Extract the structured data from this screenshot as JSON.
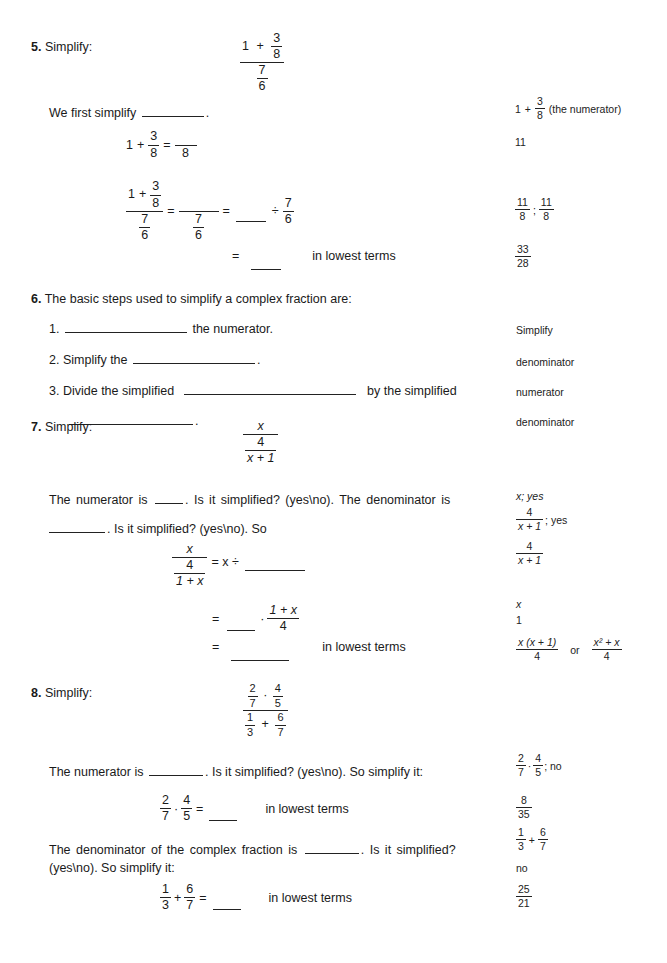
{
  "problems": [
    {
      "number": "5.",
      "prompt": "Simplify:",
      "expression": {
        "num_whole": "1",
        "num_op": "+",
        "num_frac": [
          "3",
          "8"
        ],
        "den_frac": [
          "7",
          "6"
        ]
      },
      "step1": {
        "text_before": "We first simplify",
        "text_after": "."
      },
      "step2": {
        "lhs_whole": "1",
        "op": "+",
        "lhs_frac": [
          "3",
          "8"
        ],
        "eq": "=",
        "rhs_den": "8"
      },
      "step3": {
        "eq": "=",
        "div": "÷",
        "div_frac": [
          "7",
          "6"
        ],
        "den_frac": [
          "7",
          "6"
        ]
      },
      "step4": {
        "eq": "=",
        "suffix": "in lowest terms"
      },
      "answers": {
        "a1_whole": "1",
        "a1_op": "+",
        "a1_frac": [
          "3",
          "8"
        ],
        "a1_note": "(the numerator)",
        "a2": "11",
        "a3_frac1": [
          "11",
          "8"
        ],
        "a3_sep": ";",
        "a3_frac2": [
          "11",
          "8"
        ],
        "a4_frac": [
          "33",
          "28"
        ]
      }
    },
    {
      "number": "6.",
      "prompt": "The basic steps used to simplify a complex fraction are:",
      "steps": [
        {
          "index": "1.",
          "before": "",
          "after": "the numerator."
        },
        {
          "index": "2.",
          "before": "Simplify the",
          "after": "."
        },
        {
          "index": "3.",
          "before": "Divide the simplified",
          "after": "by the simplified"
        },
        {
          "index": "",
          "before": "",
          "after": "."
        }
      ],
      "answers": [
        "Simplify",
        "denominator",
        "numerator",
        "denominator"
      ]
    },
    {
      "number": "7.",
      "prompt": "Simplify:",
      "expression": {
        "num": "x",
        "den_frac": [
          "4",
          "x + 1"
        ]
      },
      "line1": {
        "a": "The numerator is",
        "b": ". Is it simplified? (yes\\no). The denominator is"
      },
      "line2": {
        "b": ". Is it simplified? (yes\\no). So"
      },
      "eq1": {
        "num": "x",
        "den_frac": [
          "4",
          "1 + x"
        ],
        "rhs": "= x ÷"
      },
      "eq2": {
        "eq": "=",
        "dot": "·",
        "frac": [
          "1 + x",
          "4"
        ]
      },
      "eq3": {
        "eq": "=",
        "suffix": "in lowest terms"
      },
      "answers": {
        "a1": "x; yes",
        "a2_frac": [
          "4",
          "x + 1"
        ],
        "a2_suffix": "; yes",
        "a3_frac": [
          "4",
          "x + 1"
        ],
        "a4": "x",
        "a5": "1",
        "a6_frac1": [
          "x (x + 1)",
          "4"
        ],
        "a6_or": "or",
        "a6_frac2": [
          "x² + x",
          "4"
        ]
      }
    },
    {
      "number": "8.",
      "prompt": "Simplify:",
      "expression": {
        "num_frac1": [
          "2",
          "7"
        ],
        "num_dot": "·",
        "num_frac2": [
          "4",
          "5"
        ],
        "den_frac1": [
          "1",
          "3"
        ],
        "den_op": "+",
        "den_frac2": [
          "6",
          "7"
        ]
      },
      "line1": {
        "a": "The numerator is",
        "b": ". Is it simplified? (yes\\no). So simplify it:"
      },
      "eq1": {
        "frac1": [
          "2",
          "7"
        ],
        "dot": "·",
        "frac2": [
          "4",
          "5"
        ],
        "eq": "=",
        "suffix": "in lowest terms"
      },
      "line2": {
        "a": "The denominator of the complex fraction is",
        "b": ". Is it simplified?",
        "c": "(yes\\no). So simplify it:"
      },
      "eq2": {
        "frac1": [
          "1",
          "3"
        ],
        "op": "+",
        "frac2": [
          "6",
          "7"
        ],
        "eq": "=",
        "suffix": "in lowest terms"
      },
      "answers": {
        "a1_frac1": [
          "2",
          "7"
        ],
        "a1_dot": "·",
        "a1_frac2": [
          "4",
          "5"
        ],
        "a1_suffix": "; no",
        "a2_frac": [
          "8",
          "35"
        ],
        "a3_frac1": [
          "1",
          "3"
        ],
        "a3_op": "+",
        "a3_frac2": [
          "6",
          "7"
        ],
        "a4": "no",
        "a5_frac": [
          "25",
          "21"
        ]
      }
    }
  ]
}
